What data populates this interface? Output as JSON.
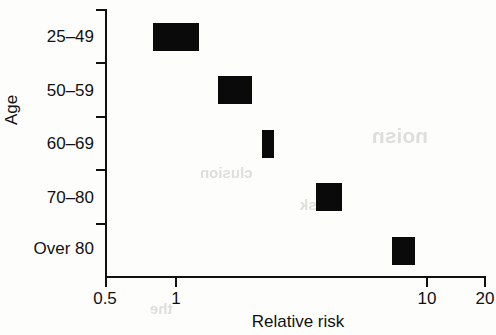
{
  "chart_data": {
    "type": "bar",
    "orientation": "horizontal",
    "title": "",
    "subtitle": "",
    "xlabel": "Relative risk",
    "ylabel": "Age",
    "xscale": "log",
    "xlim": [
      0.5,
      20
    ],
    "xticks": [
      0.5,
      1,
      10,
      20
    ],
    "xtick_labels": [
      "0.5",
      "1",
      "10",
      "20"
    ],
    "grid": false,
    "legend": null,
    "categories": [
      "25–49",
      "50–59",
      "60–69",
      "70–80",
      "Over 80"
    ],
    "series": [
      {
        "name": "Relative risk interval",
        "kind": "interval-box",
        "color": "#0a0a0a",
        "values": [
          {
            "category": "25–49",
            "low": 0.8,
            "high": 1.25,
            "center": 1.0
          },
          {
            "category": "50–59",
            "low": 1.5,
            "high": 2.1,
            "center": 1.78
          },
          {
            "category": "60–69",
            "low": 2.3,
            "high": 2.6,
            "center": 2.45
          },
          {
            "category": "70–80",
            "low": 3.9,
            "high": 5.0,
            "center": 4.4
          },
          {
            "category": "Over 80",
            "low": 8.2,
            "high": 10.2,
            "center": 9.2
          }
        ]
      }
    ],
    "annotations": []
  },
  "axes": {
    "y_title": "Age",
    "x_title": "Relative risk",
    "x_tick_labels": [
      "0.5",
      "1",
      "10",
      "20"
    ],
    "y_tick_labels": [
      "25–49",
      "50–59",
      "60–69",
      "70–80",
      "Over 80"
    ]
  },
  "bleed_through": {
    "note": "faint show-through text from reverse of scanned page",
    "fragments": [
      "noisn",
      "clusion",
      "risk",
      "the"
    ]
  }
}
